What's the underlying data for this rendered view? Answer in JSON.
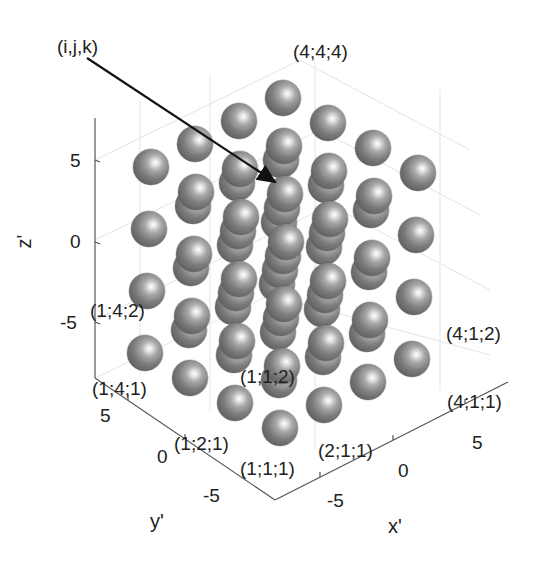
{
  "chart_data": {
    "type": "scatter3d",
    "title": "",
    "xlabel": "x'",
    "ylabel": "y'",
    "zlabel": "z'",
    "x_ticks": [
      "-5",
      "0",
      "5"
    ],
    "y_ticks": [
      "-5",
      "0",
      "5"
    ],
    "z_ticks": [
      "-5",
      "0",
      "5"
    ],
    "grid": true,
    "lattice_size": [
      4,
      4,
      4
    ],
    "point_labels": [
      "(4;4;4)",
      "(1;4;2)",
      "(4;1;2)",
      "(1;4;1)",
      "(4;1;1)",
      "(1;1;2)",
      "(1;2;1)",
      "(2;1;1)",
      "(1;1;1)"
    ],
    "annotation": {
      "text": "(i,j,k)",
      "arrow": true
    }
  },
  "labels": {
    "annotation": "(i,j,k)",
    "p444": "(4;4;4)",
    "p142": "(1;4;2)",
    "p412": "(4;1;2)",
    "p141": "(1;4;1)",
    "p411": "(4;1;1)",
    "p112": "(1;1;2)",
    "p121": "(1;2;1)",
    "p211": "(2;1;1)",
    "p111": "(1;1;1)"
  },
  "axes": {
    "z": {
      "title": "z'",
      "ticks": [
        "5",
        "0",
        "-5"
      ]
    },
    "y": {
      "title": "y'",
      "ticks": [
        "5",
        "0",
        "-5"
      ]
    },
    "x": {
      "title": "x'",
      "ticks": [
        "-5",
        "0",
        "5"
      ]
    }
  }
}
